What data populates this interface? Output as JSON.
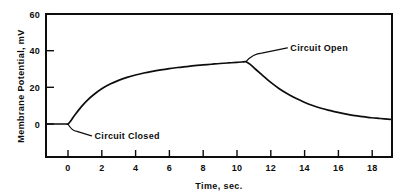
{
  "chart_data": {
    "type": "line",
    "title": "",
    "xlabel": "Time, sec.",
    "ylabel": "Membrane Potential, mV",
    "xlim": [
      -1.3,
      19.2
    ],
    "ylim": [
      -13,
      60
    ],
    "grid": false,
    "legend_position": "none",
    "xticks": [
      0,
      2,
      4,
      6,
      8,
      10,
      12,
      14,
      16,
      18
    ],
    "xticklabels": [
      "0",
      "2",
      "4",
      "6",
      "8",
      "10",
      "12",
      "14",
      "16",
      "18"
    ],
    "yticks": [
      0,
      20,
      40,
      60
    ],
    "yticklabels": [
      "0",
      "20",
      "40",
      "60"
    ],
    "series": [
      {
        "name": "Membrane Potential",
        "x": [
          -1.3,
          -0.8,
          -0.4,
          -0.1,
          0.0,
          0.15,
          0.3,
          0.5,
          0.8,
          1.1,
          1.5,
          2.0,
          2.5,
          3.0,
          3.5,
          4.0,
          4.5,
          5.0,
          5.5,
          6.0,
          6.5,
          7.0,
          7.5,
          8.0,
          8.5,
          9.0,
          9.5,
          10.0,
          10.4,
          10.55,
          10.8,
          11.1,
          11.5,
          12.0,
          12.5,
          13.0,
          13.5,
          14.0,
          14.5,
          15.0,
          15.5,
          16.0,
          16.5,
          17.0,
          17.5,
          18.0,
          18.5,
          19.1
        ],
        "y": [
          0.0,
          0.0,
          0.0,
          0.0,
          0.0,
          1.5,
          3.5,
          6.0,
          9.5,
          12.5,
          15.8,
          19.2,
          21.8,
          23.8,
          25.4,
          26.7,
          27.8,
          28.7,
          29.5,
          30.2,
          30.8,
          31.3,
          31.8,
          32.2,
          32.6,
          33.0,
          33.3,
          33.6,
          33.9,
          34.0,
          32.5,
          30.0,
          26.8,
          22.8,
          19.4,
          16.5,
          14.0,
          11.9,
          10.1,
          8.6,
          7.4,
          6.3,
          5.4,
          4.6,
          4.0,
          3.4,
          3.0,
          2.5
        ]
      }
    ],
    "annotations": [
      {
        "label": "Circuit Closed",
        "point_x": 0.0,
        "point_y": 0.0,
        "text_x": 1.4,
        "text_y": -6.5
      },
      {
        "label": "Circuit Open",
        "point_x": 10.55,
        "point_y": 34.0,
        "text_x": 13.0,
        "text_y": 41.5
      }
    ],
    "colors": {
      "line": "#0d0d0d",
      "axis": "#0d0d0d",
      "background": "#ffffff",
      "text": "#0d0d0d"
    }
  }
}
